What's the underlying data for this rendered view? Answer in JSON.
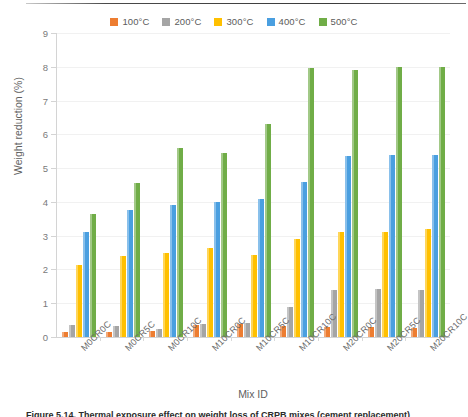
{
  "figure": {
    "ylabel": "Weight reduction (%)",
    "xlabel": "Mix ID",
    "caption_partial": "Figure 5.14. Thermal exposure effect on weight loss of CRPB mixes (cement replacement)"
  },
  "legend": {
    "position": "top-center",
    "items": [
      {
        "label": "100°C",
        "color": "#ed7d31"
      },
      {
        "label": "200°C",
        "color": "#a5a5a5"
      },
      {
        "label": "300°C",
        "color": "#ffc000"
      },
      {
        "label": "400°C",
        "color": "#4a9fe0"
      },
      {
        "label": "500°C",
        "color": "#70ad47"
      }
    ]
  },
  "yaxis": {
    "ticks": [
      "0",
      "1",
      "2",
      "3",
      "4",
      "5",
      "6",
      "7",
      "8",
      "9"
    ]
  },
  "chart_data": {
    "type": "bar",
    "title": "",
    "subtitle": "",
    "xlabel": "Mix ID",
    "ylabel": "Weight reduction (%)",
    "ylim": [
      0,
      9
    ],
    "ytick_step": 1,
    "grid": true,
    "legend_position": "top-center",
    "categories": [
      "M0CR0C",
      "M0CR5C",
      "M0CR10C",
      "M10CR0C",
      "M10CR5C",
      "M10CR10C",
      "M20CR0C",
      "M20CR5C",
      "M20CR10C"
    ],
    "series": [
      {
        "name": "100°C",
        "color": "#ed7d31",
        "values": [
          0.15,
          0.15,
          0.18,
          0.35,
          0.38,
          0.32,
          0.3,
          0.3,
          0.28
        ]
      },
      {
        "name": "200°C",
        "color": "#a5a5a5",
        "values": [
          0.35,
          0.32,
          0.25,
          0.4,
          0.42,
          0.9,
          1.38,
          1.42,
          1.38
        ]
      },
      {
        "name": "300°C",
        "color": "#ffc000",
        "values": [
          2.12,
          2.4,
          2.48,
          2.65,
          2.42,
          2.9,
          3.1,
          3.1,
          3.2
        ]
      },
      {
        "name": "400°C",
        "color": "#4a9fe0",
        "values": [
          3.1,
          3.75,
          3.9,
          4.0,
          4.1,
          4.6,
          5.35,
          5.38,
          5.4
        ]
      },
      {
        "name": "500°C",
        "color": "#70ad47",
        "values": [
          3.65,
          4.55,
          5.6,
          5.45,
          6.32,
          7.95,
          7.9,
          7.98,
          8.0
        ]
      }
    ]
  }
}
